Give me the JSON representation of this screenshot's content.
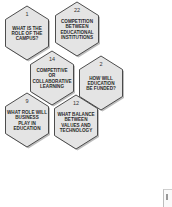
{
  "diagram": {
    "colors": {
      "hex_fill": "#e4e4e4",
      "hex_stroke": "#3a3a3a",
      "shadow": "#bdbdbd",
      "text": "#2a2a2a"
    },
    "hexagons": [
      {
        "number": "1",
        "lines": [
          "WHAT IS THE",
          "ROLE OF THE",
          "CAMPUS?"
        ],
        "cx": 27,
        "cy": 33
      },
      {
        "number": "22",
        "lines": [
          "COMPETITION",
          "BETWEEN",
          "EDUCATIONAL",
          "INSTITUTIONS"
        ],
        "cx": 77,
        "cy": 29
      },
      {
        "number": "14",
        "lines": [
          "COMPETITIVE",
          "OR",
          "COLLABORATIVE",
          "LEARNING"
        ],
        "cx": 52,
        "cy": 78
      },
      {
        "number": "2",
        "lines": [
          "HOW WILL",
          "EDUCATION",
          "BE FUNDED?"
        ],
        "cx": 101,
        "cy": 83
      },
      {
        "number": "9",
        "lines": [
          "WHAT ROLE WILL",
          "BUSINESS",
          "PLAY IN",
          "EDUCATION"
        ],
        "cx": 27,
        "cy": 120
      },
      {
        "number": "12",
        "lines": [
          "WHAT BALANCE",
          "BETWEEN",
          "VALUES AND",
          "TECHNOLOGY"
        ],
        "cx": 76,
        "cy": 122
      }
    ]
  }
}
